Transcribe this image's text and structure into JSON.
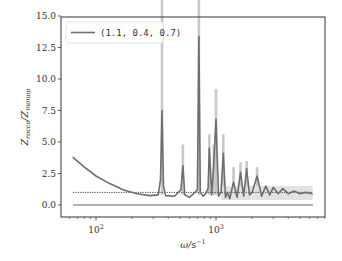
{
  "chart_data": {
    "type": "line",
    "title": "",
    "xlabel": "ω/s⁻¹",
    "ylabel": "Z_rocco / Z_monop",
    "xscale": "log",
    "xlim": [
      55,
      7000
    ],
    "ylim": [
      -0.9,
      15.0
    ],
    "grid": false,
    "legend": {
      "position": "upper left",
      "entries": [
        "(1.1, 0.4, 0.7)"
      ]
    },
    "yticks": [
      "0.0",
      "2.5",
      "5.0",
      "7.5",
      "10.0",
      "12.5",
      "15.0"
    ],
    "xticks": [
      "10²",
      "10³"
    ],
    "reference_lines": [
      {
        "y": 1.0,
        "style": "dotted",
        "color": "#333333"
      },
      {
        "y": 0.0,
        "style": "solid",
        "color": "#555555"
      }
    ],
    "series": [
      {
        "name": "(1.1, 0.4, 0.7)",
        "color": "#6e6e6e",
        "band_color": "#c8c8c8",
        "x": [
          64,
          80,
          100,
          130,
          170,
          220,
          280,
          330,
          345,
          355,
          365,
          380,
          450,
          510,
          530,
          550,
          600,
          650,
          700,
          720,
          740,
          780,
          820,
          860,
          880,
          920,
          960,
          1000,
          1050,
          1100,
          1150,
          1200,
          1250,
          1300,
          1400,
          1500,
          1600,
          1700,
          1800,
          1900,
          2000,
          2200,
          2400,
          2600,
          2800,
          3000,
          3300,
          3600,
          4000,
          4500,
          5000,
          5600,
          6400
        ],
        "y": [
          3.8,
          3.0,
          2.3,
          1.7,
          1.2,
          0.9,
          0.75,
          0.8,
          2.0,
          7.5,
          1.5,
          0.75,
          0.7,
          1.2,
          3.1,
          0.8,
          0.6,
          0.9,
          1.2,
          13.4,
          1.0,
          0.7,
          0.9,
          1.3,
          4.5,
          0.8,
          3.5,
          6.8,
          0.7,
          1.0,
          4.1,
          0.6,
          1.0,
          0.5,
          1.8,
          0.6,
          2.6,
          0.7,
          2.9,
          0.8,
          1.0,
          2.3,
          0.7,
          1.5,
          0.8,
          1.4,
          0.9,
          1.3,
          0.9,
          1.1,
          0.9,
          1.0,
          0.9
        ],
        "band_upper_peaks": [
          {
            "x": 355,
            "y": 15.0
          },
          {
            "x": 530,
            "y": 4.8
          },
          {
            "x": 720,
            "y": 15.0
          },
          {
            "x": 880,
            "y": 5.6
          },
          {
            "x": 960,
            "y": 4.8
          },
          {
            "x": 1000,
            "y": 9.2
          },
          {
            "x": 1150,
            "y": 5.6
          },
          {
            "x": 1400,
            "y": 3.0
          },
          {
            "x": 1600,
            "y": 3.4
          },
          {
            "x": 1800,
            "y": 3.5
          },
          {
            "x": 2200,
            "y": 3.0
          }
        ]
      }
    ]
  }
}
